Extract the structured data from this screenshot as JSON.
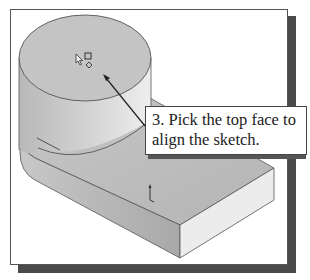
{
  "figure": {
    "callout": {
      "line1": "3. Pick the top face to",
      "line2": "align the sketch."
    },
    "icons": {
      "cursor": "pointer-arrow-icon",
      "face_select": "face-select-icon",
      "origin": "coordinate-axis-icon"
    },
    "colors": {
      "top_face": "#c4c4c4",
      "block_top": "#bdbdbd",
      "block_front": "#ececec",
      "shadow": "#4a4a4a"
    }
  }
}
